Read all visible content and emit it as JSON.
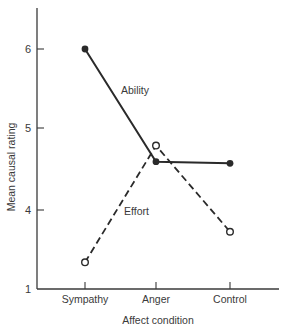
{
  "chart_data": {
    "type": "line",
    "title": "",
    "xlabel": "Affect condition",
    "ylabel": "Mean causal rating",
    "categories": [
      "Sympathy",
      "Anger",
      "Control"
    ],
    "y_ticks": [
      {
        "label": "6",
        "value": 6
      },
      {
        "label": "5",
        "value": 5
      },
      {
        "label": "4",
        "value": 4
      },
      {
        "label": "1",
        "value": 1
      }
    ],
    "axis_break": "y-axis jumps from 1 to ~3.0 at the origin (labeled 1)",
    "ylim": [
      3.0,
      6.5
    ],
    "grid": false,
    "legend": "inline labels",
    "series": [
      {
        "name": "Ability",
        "values": [
          6.0,
          4.6,
          4.58
        ],
        "line_style": "solid",
        "marker": "filled-circle",
        "color": "#2a2a2a"
      },
      {
        "name": "Effort",
        "values": [
          3.35,
          4.8,
          3.73
        ],
        "line_style": "dashed",
        "marker": "open-circle",
        "color": "#2a2a2a"
      }
    ]
  },
  "labels": {
    "ability": "Ability",
    "effort": "Effort"
  }
}
